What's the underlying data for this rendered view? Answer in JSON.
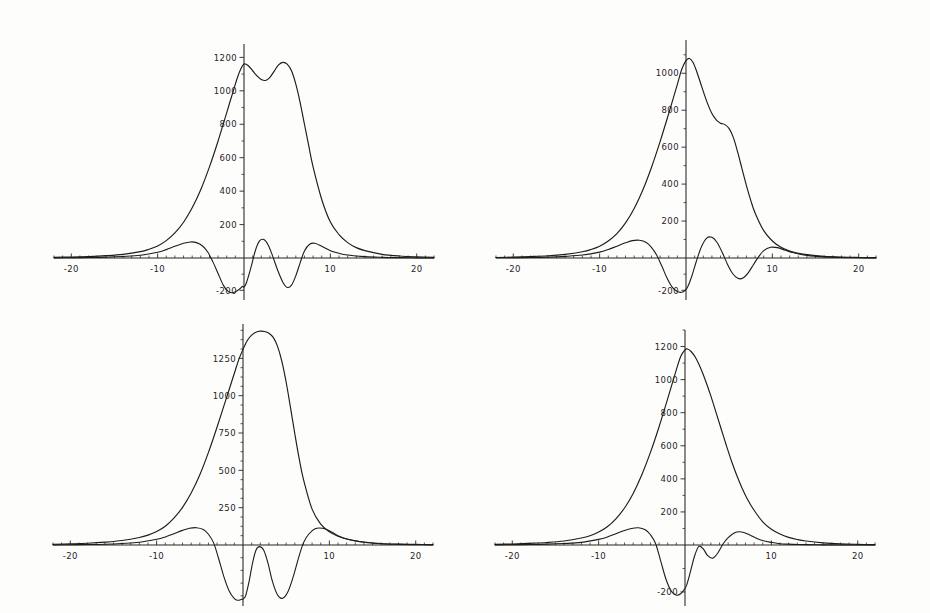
{
  "figure": {
    "title": "",
    "background_color": "#fdfdfc",
    "line_color": "#1d1c18",
    "axis_color": "#26241f",
    "panel_count": 4,
    "layout": "2x2 grid of line plots"
  },
  "chart_data": [
    {
      "id": "panel-top-left",
      "type": "line",
      "title": "",
      "xlabel": "",
      "ylabel": "",
      "xlim": [
        -22,
        22
      ],
      "ylim": [
        -260,
        1280
      ],
      "grid": false,
      "legend": "none",
      "xticks": [
        -20,
        -10,
        10,
        20
      ],
      "xtick_labels": [
        "-20",
        "-10",
        "10",
        "20"
      ],
      "yticks": [
        200,
        400,
        600,
        800,
        1000,
        1200,
        -200
      ],
      "ytick_labels": [
        "200",
        "400",
        "600",
        "800",
        "1000",
        "1200",
        "-200"
      ],
      "series": [
        {
          "name": "envelope",
          "x": [
            -22,
            -20,
            -18,
            -16,
            -14,
            -12,
            -11,
            -10,
            -9,
            -8,
            -7,
            -6,
            -5,
            -4,
            -3,
            -2,
            -1,
            -0.5,
            0,
            0.5,
            1,
            1.5,
            2,
            2.5,
            3,
            3.5,
            4,
            4.5,
            5,
            5.5,
            6,
            6.5,
            7,
            7.5,
            8,
            9,
            10,
            11,
            12,
            13,
            14,
            16,
            18,
            20,
            22
          ],
          "y": [
            4,
            6,
            9,
            14,
            22,
            38,
            52,
            72,
            104,
            150,
            214,
            300,
            410,
            545,
            700,
            870,
            1040,
            1115,
            1160,
            1150,
            1120,
            1090,
            1068,
            1062,
            1080,
            1118,
            1155,
            1170,
            1160,
            1120,
            1040,
            930,
            800,
            670,
            545,
            350,
            215,
            140,
            92,
            62,
            44,
            22,
            12,
            7,
            4
          ]
        },
        {
          "name": "oscillation",
          "x": [
            -22,
            -20,
            -18,
            -16,
            -14,
            -12,
            -10,
            -9,
            -8,
            -7,
            -6.2,
            -5.5,
            -4.8,
            -4.2,
            -3.6,
            -3,
            -2.4,
            -1.8,
            -1.2,
            -0.6,
            -0.2,
            0,
            0.3,
            0.8,
            1.3,
            1.8,
            2.3,
            2.8,
            3.3,
            3.9,
            4.5,
            5,
            5.5,
            6,
            6.5,
            7,
            7.6,
            8.2,
            9,
            10,
            11,
            12,
            14,
            16,
            18,
            20,
            22
          ],
          "y": [
            1,
            2,
            3,
            5,
            9,
            16,
            34,
            50,
            70,
            88,
            96,
            92,
            72,
            36,
            -24,
            -96,
            -168,
            -208,
            -214,
            -196,
            -176,
            -180,
            -150,
            -60,
            42,
            102,
            110,
            78,
            14,
            -76,
            -150,
            -182,
            -168,
            -110,
            -30,
            42,
            82,
            88,
            70,
            44,
            28,
            18,
            8,
            4,
            2,
            1,
            0
          ]
        }
      ]
    },
    {
      "id": "panel-top-right",
      "type": "line",
      "title": "",
      "xlabel": "",
      "ylabel": "",
      "xlim": [
        -22,
        22
      ],
      "ylim": [
        -260,
        1180
      ],
      "grid": false,
      "legend": "none",
      "xticks": [
        -20,
        -10,
        10,
        20
      ],
      "xtick_labels": [
        "-20",
        "-10",
        "10",
        "20"
      ],
      "yticks": [
        200,
        400,
        600,
        800,
        1000,
        -200
      ],
      "ytick_labels": [
        "200",
        "400",
        "600",
        "800",
        "1000",
        "-200"
      ],
      "series": [
        {
          "name": "envelope",
          "x": [
            -22,
            -20,
            -18,
            -16,
            -14,
            -12,
            -11,
            -10,
            -9,
            -8,
            -7,
            -6,
            -5,
            -4,
            -3,
            -2,
            -1,
            -0.5,
            0,
            0.4,
            0.8,
            1.2,
            1.8,
            2.4,
            3,
            3.5,
            4,
            4.5,
            5,
            5.5,
            6,
            6.5,
            7,
            7.5,
            8,
            9,
            10,
            11,
            12,
            13,
            14,
            16,
            18,
            20,
            22
          ],
          "y": [
            3,
            5,
            8,
            12,
            20,
            34,
            46,
            64,
            92,
            132,
            190,
            268,
            368,
            490,
            630,
            782,
            940,
            1020,
            1068,
            1080,
            1060,
            1015,
            930,
            848,
            782,
            748,
            730,
            722,
            700,
            650,
            570,
            480,
            392,
            312,
            244,
            148,
            92,
            58,
            38,
            26,
            18,
            9,
            5,
            3,
            2
          ]
        },
        {
          "name": "oscillation",
          "x": [
            -22,
            -20,
            -18,
            -16,
            -14,
            -12,
            -10,
            -9,
            -8,
            -7,
            -6.2,
            -5.4,
            -4.6,
            -4,
            -3.4,
            -2.8,
            -2.2,
            -1.6,
            -1,
            -0.5,
            -0.1,
            0.2,
            0.7,
            1.2,
            1.8,
            2.4,
            3,
            3.6,
            4.2,
            4.8,
            5.4,
            6,
            6.6,
            7.2,
            7.8,
            8.4,
            9,
            9.8,
            10.6,
            11.5,
            12.5,
            14,
            16,
            18,
            20,
            22
          ],
          "y": [
            1,
            2,
            3,
            5,
            9,
            16,
            32,
            46,
            64,
            82,
            94,
            96,
            84,
            58,
            16,
            -50,
            -124,
            -180,
            -208,
            -212,
            -200,
            -178,
            -108,
            -20,
            62,
            108,
            112,
            84,
            30,
            -38,
            -96,
            -126,
            -124,
            -92,
            -42,
            6,
            40,
            58,
            56,
            42,
            28,
            14,
            6,
            3,
            1,
            0
          ]
        }
      ]
    },
    {
      "id": "panel-bottom-left",
      "type": "line",
      "title": "",
      "xlabel": "",
      "ylabel": "",
      "xlim": [
        -22,
        22
      ],
      "ylim": [
        -300,
        1480
      ],
      "grid": false,
      "legend": "none",
      "xticks": [
        -20,
        -10,
        10,
        20
      ],
      "xtick_labels": [
        "-20",
        "-10",
        "10",
        "20"
      ],
      "yticks": [
        250,
        500,
        750,
        1000,
        1250
      ],
      "ytick_labels": [
        "250",
        "500",
        "750",
        "1000",
        "1250"
      ],
      "series": [
        {
          "name": "envelope",
          "x": [
            -22,
            -20,
            -18,
            -16,
            -14,
            -12,
            -11,
            -10,
            -9,
            -8,
            -7,
            -6,
            -5,
            -4,
            -3,
            -2,
            -1,
            -0.5,
            0,
            0.5,
            1,
            1.5,
            2,
            2.5,
            3,
            3.5,
            4,
            4.5,
            5,
            5.5,
            6,
            6.5,
            7,
            8,
            9,
            10,
            11,
            12,
            13,
            14,
            16,
            18,
            20,
            22
          ],
          "y": [
            5,
            8,
            12,
            19,
            30,
            50,
            66,
            90,
            126,
            180,
            252,
            348,
            470,
            620,
            790,
            970,
            1150,
            1240,
            1310,
            1370,
            1405,
            1425,
            1432,
            1430,
            1418,
            1390,
            1330,
            1230,
            1090,
            920,
            745,
            580,
            440,
            240,
            140,
            88,
            58,
            40,
            28,
            20,
            10,
            6,
            4,
            2
          ]
        },
        {
          "name": "oscillation",
          "x": [
            -22,
            -20,
            -18,
            -16,
            -14,
            -12,
            -10,
            -9,
            -8,
            -7,
            -6.2,
            -5.4,
            -4.6,
            -4,
            -3.4,
            -2.8,
            -2.2,
            -1.6,
            -1,
            -0.6,
            -0.2,
            0,
            0.3,
            0.7,
            1.1,
            1.5,
            1.9,
            2.4,
            2.9,
            3.4,
            4,
            4.6,
            5.2,
            5.8,
            6.4,
            7,
            7.6,
            8.4,
            9.2,
            10,
            11,
            12,
            14,
            16,
            18,
            20,
            22
          ],
          "y": [
            1,
            2,
            3,
            5,
            10,
            18,
            38,
            54,
            76,
            98,
            112,
            116,
            104,
            72,
            14,
            -70,
            -158,
            -226,
            -264,
            -272,
            -268,
            -265,
            -250,
            -180,
            -90,
            -26,
            -8,
            -26,
            -90,
            -178,
            -246,
            -262,
            -230,
            -158,
            -68,
            14,
            72,
            110,
            112,
            96,
            62,
            40,
            18,
            8,
            4,
            2,
            1
          ]
        }
      ]
    },
    {
      "id": "panel-bottom-right",
      "type": "line",
      "title": "",
      "xlabel": "",
      "ylabel": "",
      "xlim": [
        -22,
        22
      ],
      "ylim": [
        -260,
        1300
      ],
      "grid": false,
      "legend": "none",
      "xticks": [
        -20,
        -10,
        10,
        20
      ],
      "xtick_labels": [
        "-20",
        "-10",
        "10",
        "20"
      ],
      "yticks": [
        200,
        400,
        600,
        800,
        1000,
        1200,
        -200
      ],
      "ytick_labels": [
        "200",
        "400",
        "600",
        "800",
        "1000",
        "1200",
        "-200"
      ],
      "series": [
        {
          "name": "envelope",
          "x": [
            -22,
            -20,
            -18,
            -16,
            -14,
            -12,
            -11,
            -10,
            -9,
            -8,
            -7,
            -6,
            -5,
            -4,
            -3,
            -2,
            -1,
            -0.5,
            0,
            0.3,
            0.7,
            1.2,
            1.8,
            2.4,
            3,
            3.6,
            4.2,
            4.8,
            5.4,
            6,
            6.6,
            7.2,
            8,
            9,
            10,
            11,
            12,
            13,
            14,
            16,
            18,
            20,
            22
          ],
          "y": [
            4,
            6,
            10,
            15,
            24,
            42,
            56,
            78,
            110,
            158,
            224,
            312,
            425,
            560,
            715,
            885,
            1060,
            1140,
            1180,
            1185,
            1170,
            1135,
            1070,
            990,
            900,
            800,
            700,
            600,
            505,
            420,
            345,
            280,
            210,
            140,
            95,
            66,
            46,
            33,
            24,
            13,
            7,
            4,
            2
          ]
        },
        {
          "name": "oscillation",
          "x": [
            -22,
            -20,
            -18,
            -16,
            -14,
            -12,
            -10,
            -9,
            -8,
            -7,
            -6.2,
            -5.4,
            -4.6,
            -4,
            -3.4,
            -2.8,
            -2.2,
            -1.6,
            -1,
            -0.5,
            -0.1,
            0.2,
            0.6,
            1.1,
            1.6,
            2.1,
            2.6,
            3.2,
            3.8,
            4.4,
            5,
            5.6,
            6.2,
            6.8,
            7.6,
            8.4,
            9.2,
            10,
            11,
            12,
            13,
            14,
            16,
            18,
            20,
            22
          ],
          "y": [
            1,
            2,
            3,
            5,
            9,
            16,
            34,
            48,
            68,
            88,
            100,
            104,
            92,
            62,
            8,
            -70,
            -146,
            -196,
            -214,
            -208,
            -190,
            -170,
            -118,
            -48,
            -6,
            -16,
            -44,
            -56,
            -34,
            6,
            44,
            70,
            80,
            76,
            58,
            38,
            24,
            16,
            8,
            5,
            3,
            2,
            1,
            0,
            0,
            0
          ]
        }
      ]
    }
  ]
}
